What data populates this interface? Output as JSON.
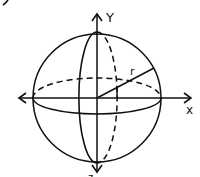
{
  "diagram": {
    "labels": {
      "y_axis": "Y",
      "x_axis": "x",
      "radius": "r",
      "z_axis_partial": "z"
    },
    "colors": {
      "ink": "#111111",
      "background": "#ffffff"
    },
    "geometry": {
      "center": [
        97,
        98
      ],
      "sphere_radius": 64,
      "equator_ellipse": {
        "rx": 64,
        "ry": 17
      },
      "meridian_ellipse": {
        "rx": 17,
        "ry": 65
      },
      "radius_endpoint": [
        154,
        68
      ]
    }
  }
}
